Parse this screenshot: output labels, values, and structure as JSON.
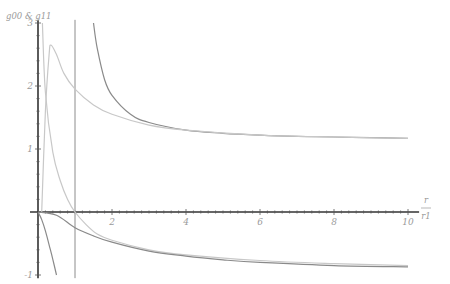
{
  "chart_data": {
    "type": "line",
    "title": "",
    "ylabel": "g00 & g11",
    "xlabel": "r / r1",
    "xlabel_num": "r",
    "xlabel_den": "r1",
    "xlim": [
      0,
      10
    ],
    "ylim": [
      -1,
      3
    ],
    "grid": false,
    "legend": "none",
    "x_ticks": [
      "2",
      "4",
      "6",
      "8",
      "10"
    ],
    "y_ticks": [
      "-1",
      "1",
      "2",
      "3"
    ],
    "vertical_line": {
      "x": 1,
      "color": "#8c8c8c"
    },
    "series": [
      {
        "name": "upper-dark",
        "color": "#8a8a8a",
        "x": [
          1.5,
          1.6,
          1.8,
          2.0,
          2.5,
          3,
          4,
          5,
          6,
          7,
          8,
          9,
          10
        ],
        "y": [
          3.0,
          2.6,
          2.1,
          1.85,
          1.55,
          1.42,
          1.3,
          1.25,
          1.22,
          1.2,
          1.19,
          1.18,
          1.17
        ]
      },
      {
        "name": "upper-light",
        "color": "#c8c8c8",
        "x": [
          0.1,
          0.2,
          0.3,
          0.35,
          0.5,
          0.7,
          1.0,
          1.5,
          2,
          3,
          4,
          6,
          8,
          10
        ],
        "y": [
          0.0,
          1.6,
          2.5,
          2.65,
          2.5,
          2.2,
          1.95,
          1.7,
          1.55,
          1.38,
          1.3,
          1.22,
          1.19,
          1.17
        ]
      },
      {
        "name": "steep-light",
        "color": "#c8c8c8",
        "x": [
          0.12,
          0.2,
          0.4,
          0.6,
          0.8,
          1.0,
          1.3,
          1.6,
          2,
          3,
          4,
          6,
          8,
          10
        ],
        "y": [
          3.0,
          1.9,
          0.95,
          0.5,
          0.2,
          0.0,
          -0.2,
          -0.35,
          -0.45,
          -0.6,
          -0.68,
          -0.77,
          -0.82,
          -0.85
        ]
      },
      {
        "name": "lower-dark",
        "color": "#8a8a8a",
        "x": [
          0,
          0.5,
          1.0,
          1.5,
          2,
          3,
          4,
          5,
          6,
          8,
          10
        ],
        "y": [
          0.0,
          -0.05,
          -0.25,
          -0.38,
          -0.48,
          -0.62,
          -0.7,
          -0.76,
          -0.8,
          -0.85,
          -0.87
        ]
      },
      {
        "name": "steep-dark",
        "color": "#8a8a8a",
        "x": [
          0,
          0.1,
          0.2,
          0.3,
          0.4,
          0.5
        ],
        "y": [
          0.0,
          -0.12,
          -0.3,
          -0.52,
          -0.75,
          -1.0
        ]
      }
    ]
  }
}
